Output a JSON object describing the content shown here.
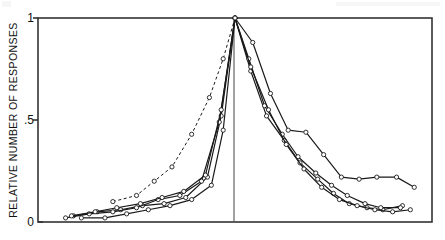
{
  "figure": {
    "kind": "scientific-line-plot",
    "background_color": "#ffffff",
    "ink_color": "#1a1a1a"
  },
  "chart_data": {
    "type": "line",
    "title": "",
    "subtitle": "",
    "xlabel": "",
    "ylabel": "RELATIVE  NUMBER  OF  RESPONSES",
    "xlim": [
      -1,
      1
    ],
    "ylim": [
      0,
      1
    ],
    "grid": false,
    "legend_position": "none",
    "legend_entries": [],
    "axis": {
      "y_ticks": [
        0,
        0.5,
        1
      ],
      "y_ticklabels": [
        "0",
        ".5",
        "1"
      ],
      "x_ticks": [],
      "x_ticklabels": [],
      "frame": "box",
      "center_reference_line_x": 0
    },
    "annotations": [
      {
        "name": "center-reference-line",
        "x": 0,
        "description": "vertical line at peak / best frequency"
      }
    ],
    "marker": "open-circle",
    "series": [
      {
        "name": "curve-1",
        "linestyle": "solid",
        "marker": "open-circle",
        "x": [
          -0.82,
          -0.7,
          -0.58,
          -0.47,
          -0.36,
          -0.25,
          -0.14,
          -0.07,
          0.0,
          0.08,
          0.16,
          0.25,
          0.33,
          0.42,
          0.5,
          0.58,
          0.67,
          0.75,
          0.85
        ],
        "y": [
          0.03,
          0.05,
          0.06,
          0.08,
          0.09,
          0.12,
          0.22,
          0.52,
          1.0,
          0.74,
          0.52,
          0.4,
          0.29,
          0.21,
          0.14,
          0.09,
          0.07,
          0.06,
          0.08
        ]
      },
      {
        "name": "curve-2",
        "linestyle": "solid",
        "marker": "open-circle",
        "x": [
          -0.86,
          -0.74,
          -0.62,
          -0.5,
          -0.39,
          -0.28,
          -0.17,
          -0.08,
          0.0,
          0.07,
          0.15,
          0.24,
          0.32,
          0.41,
          0.49,
          0.57,
          0.66,
          0.74,
          0.84
        ],
        "y": [
          0.02,
          0.04,
          0.05,
          0.07,
          0.11,
          0.13,
          0.2,
          0.49,
          1.0,
          0.8,
          0.57,
          0.43,
          0.32,
          0.24,
          0.18,
          0.13,
          0.09,
          0.07,
          0.07
        ]
      },
      {
        "name": "curve-3",
        "linestyle": "solid",
        "marker": "open-circle",
        "x": [
          -0.78,
          -0.66,
          -0.55,
          -0.44,
          -0.33,
          -0.22,
          -0.12,
          -0.06,
          0.0,
          0.09,
          0.18,
          0.27,
          0.36,
          0.45,
          0.54,
          0.63,
          0.72,
          0.82,
          0.91
        ],
        "y": [
          0.02,
          0.02,
          0.04,
          0.06,
          0.08,
          0.11,
          0.18,
          0.45,
          1.0,
          0.88,
          0.63,
          0.45,
          0.44,
          0.33,
          0.22,
          0.21,
          0.22,
          0.22,
          0.17
        ]
      },
      {
        "name": "curve-4",
        "linestyle": "solid",
        "marker": "open-circle",
        "x": [
          -0.83,
          -0.71,
          -0.6,
          -0.48,
          -0.37,
          -0.26,
          -0.15,
          -0.07,
          0.0,
          0.08,
          0.17,
          0.26,
          0.35,
          0.44,
          0.53,
          0.62,
          0.71,
          0.8,
          0.89
        ],
        "y": [
          0.03,
          0.05,
          0.07,
          0.09,
          0.12,
          0.15,
          0.23,
          0.55,
          1.0,
          0.76,
          0.55,
          0.38,
          0.26,
          0.17,
          0.11,
          0.08,
          0.06,
          0.05,
          0.06
        ]
      },
      {
        "name": "curve-5-dashed",
        "linestyle": "dashed",
        "marker": "open-circle",
        "x": [
          -0.62,
          -0.5,
          -0.41,
          -0.32,
          -0.22,
          -0.13,
          -0.06,
          0.0
        ],
        "y": [
          0.1,
          0.13,
          0.2,
          0.27,
          0.43,
          0.61,
          0.8,
          1.0
        ]
      }
    ]
  }
}
